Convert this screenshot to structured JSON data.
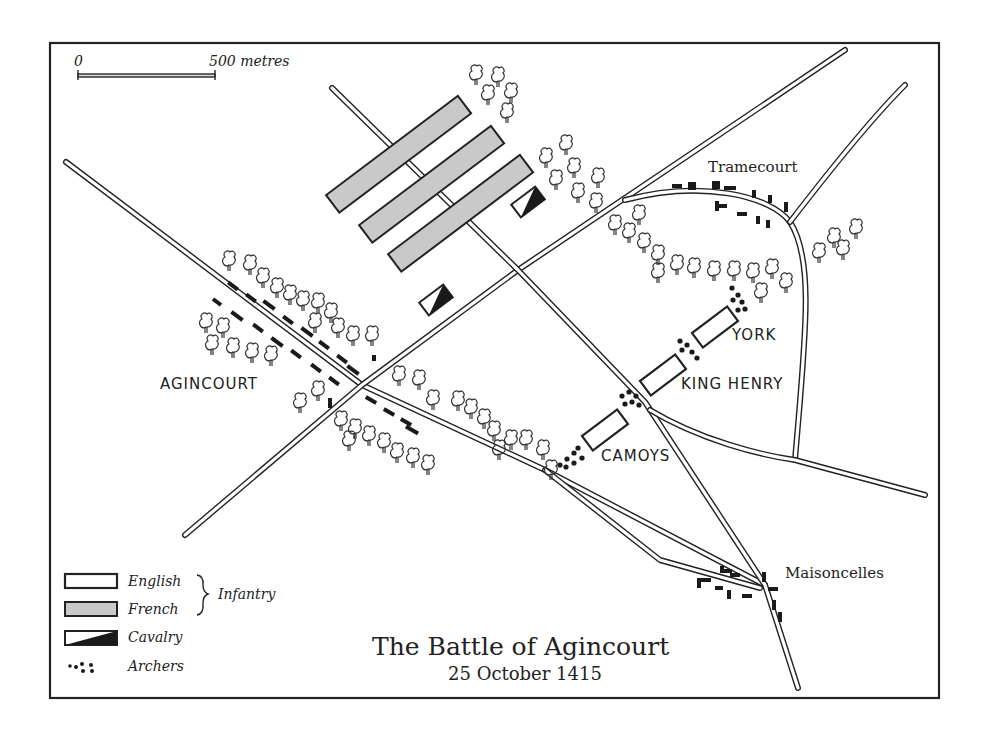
{
  "map": {
    "title": "The Battle of Agincourt",
    "subtitle": "25 October 1415",
    "scale": {
      "start_label": "0",
      "end_label": "500 metres"
    },
    "places": {
      "agincourt": "AGINCOURT",
      "tramecourt": "Tramecourt",
      "maisoncelles": "Maisoncelles"
    },
    "english_divisions": [
      "YORK",
      "KING HENRY",
      "CAMOYS"
    ],
    "legend": {
      "english": "English",
      "french": "French",
      "infantry_group": "Infantry",
      "cavalry": "Cavalry",
      "archers": "Archers"
    },
    "colors": {
      "ink": "#222222",
      "french_fill": "#c9c9c9",
      "english_fill": "#ffffff",
      "paper": "#ffffff"
    }
  }
}
